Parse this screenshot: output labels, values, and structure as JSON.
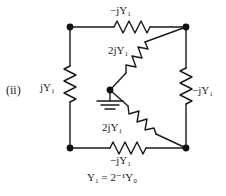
{
  "figure": {
    "index_label": "(ii)",
    "type": "electrical-circuit-schematic"
  },
  "labels": {
    "top_branch": "−jY₁",
    "left_branch": "jY₁",
    "right_branch": "−jY₁",
    "bottom_branch": "−jY₁",
    "diagonal_upper": "2jY₁",
    "diagonal_lower": "2jY₁"
  },
  "formula": {
    "text": "Y₁ = 2⁻¹Y₀",
    "lhs": "Y₁",
    "equals": "=",
    "base": "2",
    "exponent": "−1",
    "rhs_symbol": "Y₀"
  },
  "nodes": [
    {
      "name": "top-left",
      "x": 70,
      "y": 27
    },
    {
      "name": "top-right",
      "x": 186,
      "y": 27
    },
    {
      "name": "bottom-left",
      "x": 70,
      "y": 148
    },
    {
      "name": "bottom-right",
      "x": 186,
      "y": 148
    },
    {
      "name": "centre-ground",
      "x": 110,
      "y": 90
    }
  ],
  "ground": {
    "name": "ground-symbol",
    "x": 110,
    "y": 90
  },
  "colors": {
    "line": "#1a1a1a",
    "node": "#111111",
    "background": "#ffffff",
    "text": "#1a1a1a"
  }
}
